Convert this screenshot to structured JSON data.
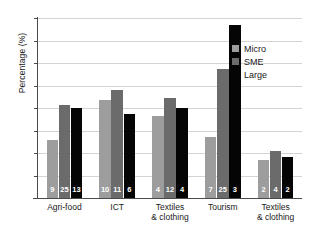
{
  "chart_data": {
    "type": "bar",
    "title": "",
    "xlabel": "",
    "ylabel": "Percentage (%)",
    "ylim": [
      0,
      80
    ],
    "ytick_step": 10,
    "yticks": [
      80,
      70,
      60,
      50,
      40,
      30,
      20,
      10,
      0
    ],
    "grid": true,
    "legend_position": "top-right",
    "categories": [
      "Agri-food",
      "ICT",
      "Textiles & clothing",
      "Tourism",
      "Textiles & clothing"
    ],
    "categories_lines": [
      [
        "Agri-food"
      ],
      [
        "ICT"
      ],
      [
        "Textiles",
        "& clothing"
      ],
      [
        "Tourism"
      ],
      [
        "Textiles",
        "& clothing"
      ]
    ],
    "series": [
      {
        "name": "Micro",
        "color": "#9d9d9d",
        "values": [
          25.8,
          43.5,
          36.4,
          27.3,
          16.7
        ],
        "counts": [
          9,
          10,
          4,
          7,
          2
        ]
      },
      {
        "name": "SME",
        "color": "#6b6b6b",
        "values": [
          41.5,
          48.2,
          44.3,
          57.2,
          20.7
        ],
        "counts": [
          25,
          11,
          12,
          25,
          4
        ]
      },
      {
        "name": "Large",
        "color": "#050505",
        "values": [
          40.2,
          37.5,
          40.0,
          76.7,
          18.2
        ],
        "counts": [
          13,
          6,
          4,
          3,
          2
        ]
      }
    ]
  },
  "axes": {
    "y_title": "Percentage (%)"
  },
  "legend": {
    "entries": [
      {
        "label": "Micro",
        "color": "#9d9d9d"
      },
      {
        "label": "SME",
        "color": "#6b6b6b"
      },
      {
        "label": "Large",
        "color": "#050505"
      }
    ]
  },
  "colors": {
    "background": "#ffffff",
    "grid": "#d4d4d4",
    "axis": "#4a4a4a",
    "text": "#1a1a1a",
    "bar_label": "#ffffff"
  }
}
